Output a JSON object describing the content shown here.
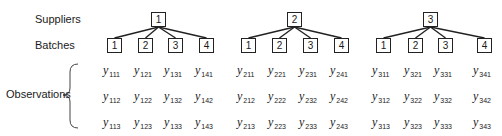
{
  "labels": {
    "suppliers": "Suppliers",
    "batches": "Batches",
    "observations": "Observations"
  },
  "observation_prefix": "y",
  "suppliers": [
    {
      "id": "1",
      "x": 151,
      "batches": [
        {
          "id": "1",
          "x": 107
        },
        {
          "id": "2",
          "x": 138
        },
        {
          "id": "3",
          "x": 168
        },
        {
          "id": "4",
          "x": 199
        }
      ]
    },
    {
      "id": "2",
      "x": 287,
      "batches": [
        {
          "id": "1",
          "x": 241
        },
        {
          "id": "2",
          "x": 272
        },
        {
          "id": "3",
          "x": 303
        },
        {
          "id": "4",
          "x": 334
        }
      ]
    },
    {
      "id": "3",
      "x": 423,
      "batches": [
        {
          "id": "1",
          "x": 376
        },
        {
          "id": "2",
          "x": 408
        },
        {
          "id": "3",
          "x": 438
        },
        {
          "id": "4",
          "x": 477
        }
      ]
    }
  ],
  "observations": {
    "rows": [
      [
        "111",
        "121",
        "131",
        "141",
        "211",
        "221",
        "231",
        "241",
        "311",
        "321",
        "331",
        "341"
      ],
      [
        "112",
        "122",
        "132",
        "142",
        "212",
        "222",
        "232",
        "242",
        "312",
        "322",
        "332",
        "342"
      ],
      [
        "113",
        "123",
        "133",
        "143",
        "213",
        "223",
        "233",
        "243",
        "313",
        "323",
        "333",
        "343"
      ]
    ]
  }
}
